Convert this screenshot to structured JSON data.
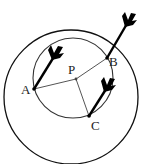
{
  "diagram": {
    "type": "geometry",
    "colors": {
      "stroke": "#111111",
      "thin_line": "#555555",
      "background": "#ffffff"
    },
    "circles": [
      {
        "name": "outer",
        "cx": 71,
        "cy": 97,
        "r": 67
      },
      {
        "name": "inner",
        "cx": 73,
        "cy": 78,
        "r": 40
      }
    ],
    "points": [
      {
        "label": "A",
        "x": 34,
        "y": 89
      },
      {
        "label": "P",
        "x": 76,
        "y": 79
      },
      {
        "label": "B",
        "x": 107,
        "y": 58
      },
      {
        "label": "C",
        "x": 89,
        "y": 116
      }
    ],
    "segments": [
      "PA",
      "PB",
      "PC"
    ],
    "arrows": [
      {
        "hits": "A"
      },
      {
        "hits": "B"
      },
      {
        "hits": "C"
      }
    ],
    "labels": {
      "A": "A",
      "B": "B",
      "C": "C",
      "P": "P"
    }
  }
}
